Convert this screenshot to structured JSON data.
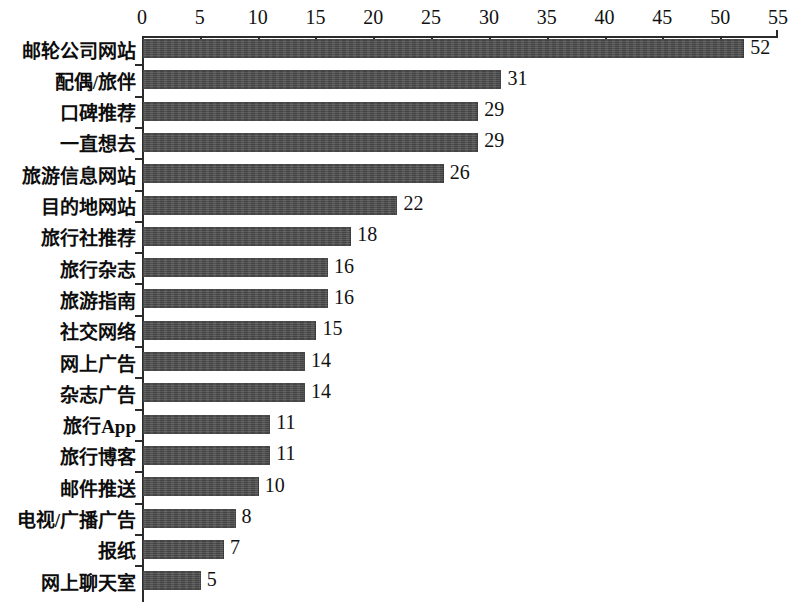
{
  "chart_data": {
    "type": "bar",
    "orientation": "horizontal",
    "title": "",
    "subtitle": "",
    "xlabel": "",
    "ylabel": "",
    "xlim": [
      0,
      55
    ],
    "xticks": [
      0,
      5,
      10,
      15,
      20,
      25,
      30,
      35,
      40,
      45,
      50,
      55
    ],
    "grid": false,
    "legend": null,
    "axis_position": "top",
    "bar_color": "#4b4b4b",
    "background_color": "#ffffff",
    "value_labels_shown": true,
    "categories": [
      "邮轮公司网站",
      "配偶/旅伴",
      "口碑推荐",
      "一直想去",
      "旅游信息网站",
      "目的地网站",
      "旅行社推荐",
      "旅行杂志",
      "旅游指南",
      "社交网络",
      "网上广告",
      "杂志广告",
      "旅行App",
      "旅行博客",
      "邮件推送",
      "电视/广播广告",
      "报纸",
      "网上聊天室"
    ],
    "values": [
      52,
      31,
      29,
      29,
      26,
      22,
      18,
      16,
      16,
      15,
      14,
      14,
      11,
      11,
      10,
      8,
      7,
      5
    ],
    "value_label_texts": [
      "52",
      "31",
      "29",
      "29",
      "26",
      "22",
      "18",
      "16",
      "16",
      "15",
      "14",
      "14",
      "11",
      "11",
      "10",
      "8",
      "7",
      "5"
    ],
    "xtick_labels": [
      "0",
      "5",
      "10",
      "15",
      "20",
      "25",
      "30",
      "35",
      "40",
      "45",
      "50",
      "55"
    ]
  }
}
